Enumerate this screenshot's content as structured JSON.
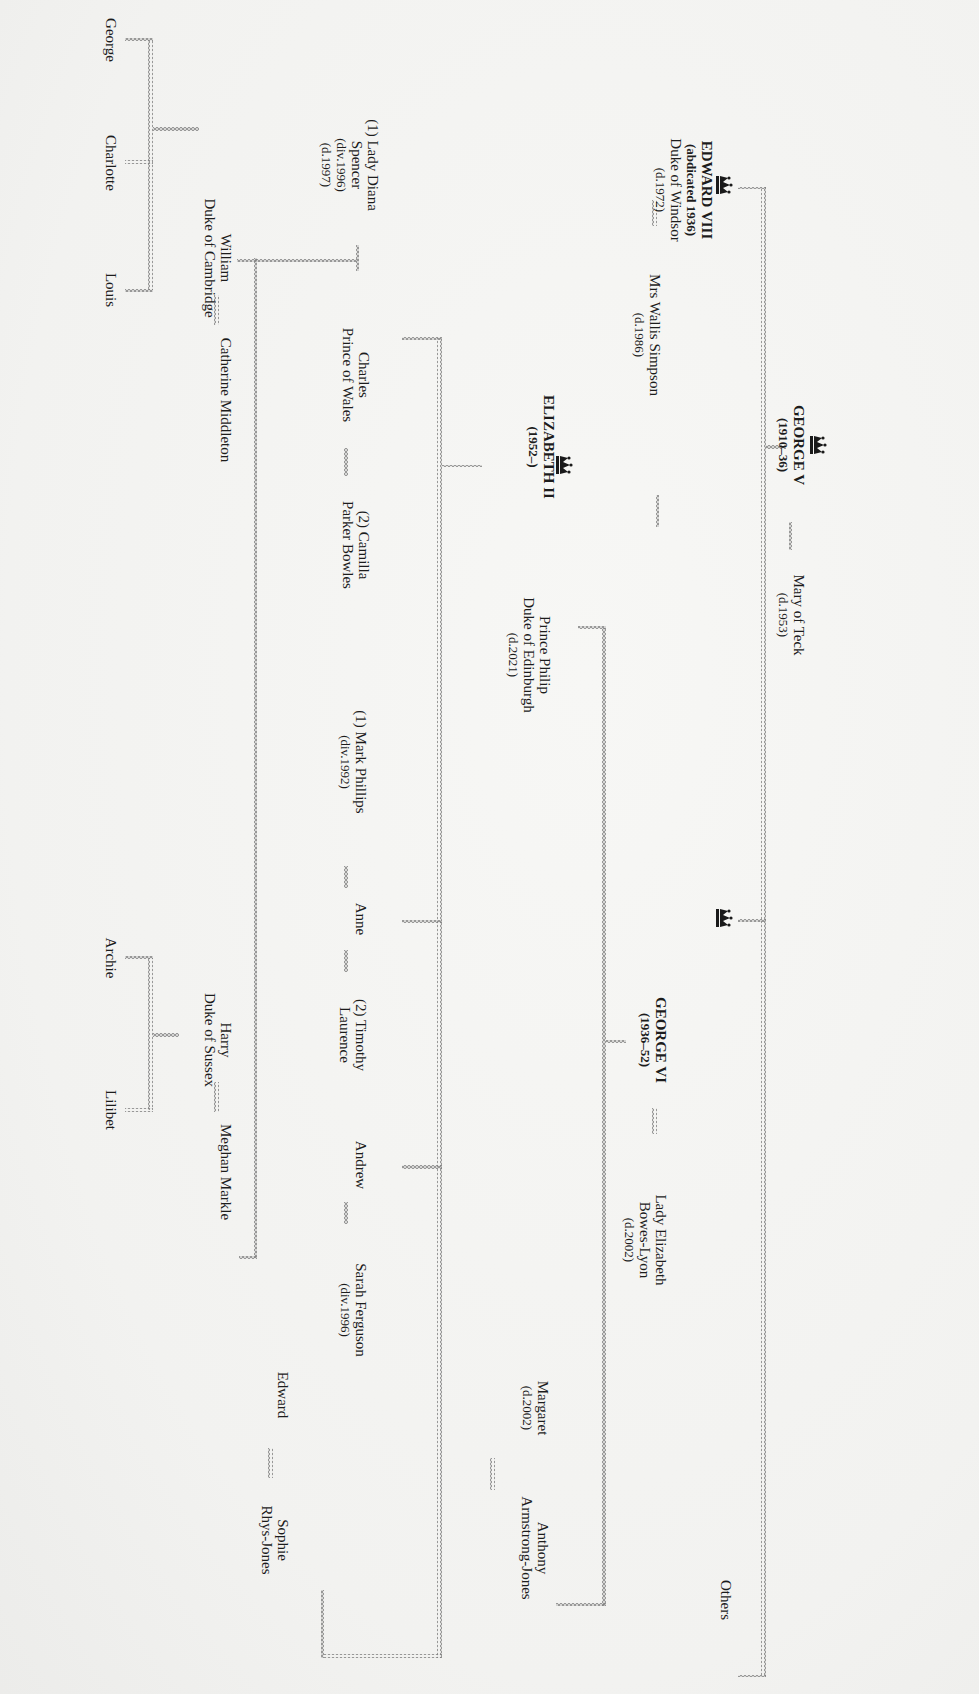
{
  "line_color": "#8a8a8a",
  "marriage_symbol": "∞∞∞∞",
  "generation_1": {
    "monarch": {
      "name": "GEORGE V",
      "reign": "(1910–36)",
      "icon": "crown-icon"
    },
    "spouse": {
      "name": "Mary of Teck",
      "note": "(d.1953)"
    }
  },
  "generation_2": {
    "edward_viii": {
      "name": "EDWARD VIII",
      "reign": "(abdicated 1936)",
      "title": "Duke of Windsor",
      "note": "(d.1972)",
      "icon": "crown-icon"
    },
    "edward_viii_spouse": {
      "name": "Mrs Wallis Simpson",
      "note": "(d.1986)"
    },
    "george_vi": {
      "name": "GEORGE VI",
      "reign": "(1936–52)",
      "icon": "crown-icon"
    },
    "george_vi_spouse": {
      "name": "Lady Elizabeth",
      "name2": "Bowes-Lyon",
      "note": "(d.2002)"
    },
    "others": {
      "name": "Others"
    }
  },
  "generation_3": {
    "elizabeth_ii": {
      "name": "ELIZABETH II",
      "reign": "(1952–)",
      "icon": "crown-icon"
    },
    "elizabeth_ii_spouse": {
      "name": "Prince Philip",
      "title": "Duke of Edinburgh",
      "note": "(d.2021)"
    },
    "margaret": {
      "name": "Margaret",
      "note": "(d.2002)"
    },
    "margaret_spouse": {
      "name": "Anthony",
      "name2": "Armstrong-Jones"
    }
  },
  "generation_4": {
    "charles": {
      "name": "Charles",
      "title": "Prince of Wales"
    },
    "charles_spouse_1": {
      "name": "(1) Lady Diana",
      "name2": "Spencer",
      "note": "(div.1996)",
      "note2": "(d.1997)"
    },
    "charles_spouse_2": {
      "name": "(2) Camilla",
      "name2": "Parker Bowles"
    },
    "anne": {
      "name": "Anne"
    },
    "anne_spouse_1": {
      "name": "(1) Mark Phillips",
      "note": "(div.1992)"
    },
    "anne_spouse_2": {
      "name": "(2) Timothy",
      "name2": "Laurence"
    },
    "andrew": {
      "name": "Andrew"
    },
    "andrew_spouse": {
      "name": "Sarah Ferguson",
      "note": "(div.1996)"
    },
    "edward": {
      "name": "Edward"
    },
    "edward_spouse": {
      "name": "Sophie",
      "name2": "Rhys-Jones"
    }
  },
  "generation_5": {
    "william": {
      "name": "William",
      "title": "Duke of Cambridge"
    },
    "william_spouse": {
      "name": "Catherine Middleton"
    },
    "harry": {
      "name": "Harry",
      "title": "Duke of Sussex"
    },
    "harry_spouse": {
      "name": "Meghan Markle"
    }
  },
  "generation_6": {
    "william_children": [
      {
        "name": "George"
      },
      {
        "name": "Charlotte"
      },
      {
        "name": "Louis"
      }
    ],
    "harry_children": [
      {
        "name": "Archie"
      },
      {
        "name": "Lilibet"
      }
    ]
  }
}
